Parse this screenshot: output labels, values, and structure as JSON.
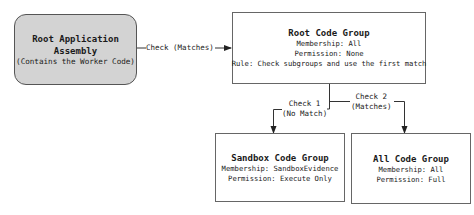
{
  "diagram": {
    "nodes": {
      "root_assembly": {
        "title_line1": "Root Application",
        "title_line2": "Assembly",
        "subtitle": "(Contains the Worker Code)"
      },
      "root_code_group": {
        "title": "Root Code Group",
        "membership": "Membership: All",
        "permission": "Permission: None",
        "rule": "Rule: Check subgroups and use the first match"
      },
      "sandbox_code_group": {
        "title": "Sandbox Code Group",
        "membership": "Membership: SandboxEvidence",
        "permission": "Permission: Execute Only"
      },
      "all_code_group": {
        "title": "All Code Group",
        "membership": "Membership: All",
        "permission": "Permission: Full"
      }
    },
    "edges": {
      "check_matches": {
        "label": "Check (Matches)"
      },
      "check_1": {
        "label_line1": "Check 1",
        "label_line2": "(No Match)"
      },
      "check_2": {
        "label_line1": "Check 2",
        "label_line2": "(Matches)"
      }
    },
    "colors": {
      "assembly_fill": "#d3d3d3",
      "box_fill": "#ffffff",
      "line": "#333333"
    }
  }
}
